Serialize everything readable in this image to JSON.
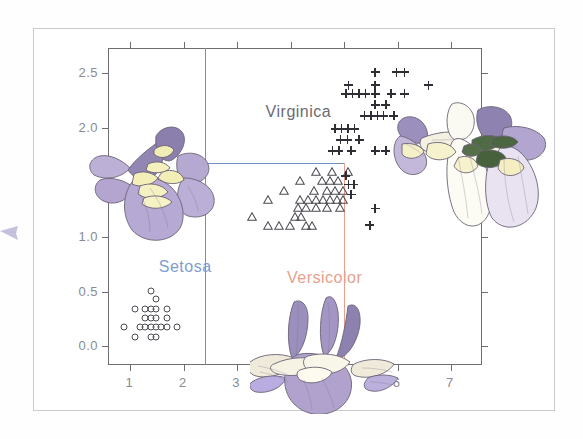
{
  "figure": {
    "arrow_icon": "right-arrow-icon",
    "frame_color": "#c9c9cf"
  },
  "chart_data": {
    "type": "scatter",
    "title": "",
    "subtitle": "",
    "xlabel": "",
    "ylabel": "",
    "xlim": [
      0.6,
      7.6
    ],
    "ylim": [
      -0.18,
      2.72
    ],
    "xticks": [
      "1",
      "2",
      "3",
      "4",
      "5",
      "6",
      "7"
    ],
    "xtick_values": [
      1,
      2,
      3,
      4,
      5,
      6,
      7
    ],
    "yticks": [
      "0.0",
      "0.5",
      "1.0",
      "1.5",
      "2.0",
      "2.5"
    ],
    "ytick_values": [
      0.0,
      0.5,
      1.0,
      1.5,
      2.0,
      2.5
    ],
    "ytick_hidden": [
      "1.5"
    ],
    "grid": false,
    "legend": "inline-annotations",
    "annotations": [
      {
        "text": "Setosa",
        "x": 1.55,
        "y": 0.8,
        "color": "#7e9ed0"
      },
      {
        "text": "Virginica",
        "x": 3.55,
        "y": 2.22,
        "color": "#6b6b72"
      },
      {
        "text": "Versicolor",
        "x": 3.95,
        "y": 0.7,
        "color": "#e8a08c"
      }
    ],
    "boundaries": [
      {
        "name": "setosa-versicolor-boundary",
        "orientation": "vertical",
        "x": 2.42,
        "y_from": -0.18,
        "y_to": 2.72,
        "color": "#6f8fc4"
      },
      {
        "name": "versicolor-virginica-top-boundary",
        "orientation": "horizontal",
        "y": 1.67,
        "x_from": 2.42,
        "x_to": 5.02,
        "color": "#6f8fc4"
      },
      {
        "name": "versicolor-right-boundary",
        "orientation": "vertical",
        "x": 5.02,
        "y_from": -0.18,
        "y_to": 1.67,
        "color": "#e8a08c"
      }
    ],
    "series": [
      {
        "name": "Setosa",
        "marker": "circle",
        "color": "#4a4a52",
        "points": [
          [
            1.4,
            0.5
          ],
          [
            1.5,
            0.42
          ],
          [
            1.1,
            0.33
          ],
          [
            1.3,
            0.33
          ],
          [
            1.4,
            0.33
          ],
          [
            1.5,
            0.33
          ],
          [
            1.7,
            0.33
          ],
          [
            1.3,
            0.25
          ],
          [
            1.4,
            0.25
          ],
          [
            1.5,
            0.25
          ],
          [
            1.7,
            0.25
          ],
          [
            0.9,
            0.17
          ],
          [
            1.2,
            0.17
          ],
          [
            1.3,
            0.17
          ],
          [
            1.4,
            0.17
          ],
          [
            1.5,
            0.17
          ],
          [
            1.6,
            0.17
          ],
          [
            1.7,
            0.17
          ],
          [
            1.9,
            0.17
          ],
          [
            1.1,
            0.08
          ],
          [
            1.4,
            0.08
          ],
          [
            1.5,
            0.08
          ]
        ]
      },
      {
        "name": "Versicolor",
        "marker": "triangle",
        "color": "#4a4a52",
        "points": [
          [
            4.5,
            1.55
          ],
          [
            4.8,
            1.55
          ],
          [
            5.1,
            1.55
          ],
          [
            4.2,
            1.47
          ],
          [
            4.6,
            1.47
          ],
          [
            4.75,
            1.47
          ],
          [
            4.9,
            1.47
          ],
          [
            3.9,
            1.38
          ],
          [
            4.45,
            1.38
          ],
          [
            4.7,
            1.38
          ],
          [
            4.85,
            1.38
          ],
          [
            5.0,
            1.38
          ],
          [
            3.6,
            1.3
          ],
          [
            4.2,
            1.3
          ],
          [
            4.35,
            1.3
          ],
          [
            4.5,
            1.3
          ],
          [
            4.62,
            1.3
          ],
          [
            4.75,
            1.3
          ],
          [
            4.88,
            1.3
          ],
          [
            5.0,
            1.3
          ],
          [
            4.15,
            1.22
          ],
          [
            4.3,
            1.22
          ],
          [
            4.5,
            1.22
          ],
          [
            4.7,
            1.22
          ],
          [
            4.95,
            1.22
          ],
          [
            3.3,
            1.14
          ],
          [
            4.1,
            1.14
          ],
          [
            4.22,
            1.14
          ],
          [
            3.6,
            1.06
          ],
          [
            3.8,
            1.06
          ],
          [
            4.0,
            1.06
          ],
          [
            4.3,
            1.06
          ],
          [
            4.42,
            1.06
          ]
        ]
      },
      {
        "name": "Virginica",
        "marker": "plus",
        "color": "#2e2e34",
        "points": [
          [
            5.6,
            2.5
          ],
          [
            6.0,
            2.5
          ],
          [
            6.15,
            2.5
          ],
          [
            5.1,
            2.38
          ],
          [
            5.6,
            2.38
          ],
          [
            6.6,
            2.38
          ],
          [
            5.05,
            2.3
          ],
          [
            5.18,
            2.3
          ],
          [
            5.3,
            2.3
          ],
          [
            5.42,
            2.3
          ],
          [
            5.6,
            2.3
          ],
          [
            5.9,
            2.3
          ],
          [
            6.15,
            2.3
          ],
          [
            5.6,
            2.2
          ],
          [
            5.8,
            2.2
          ],
          [
            5.4,
            2.1
          ],
          [
            5.52,
            2.1
          ],
          [
            5.64,
            2.1
          ],
          [
            5.76,
            2.1
          ],
          [
            5.95,
            2.1
          ],
          [
            4.85,
            1.98
          ],
          [
            4.97,
            1.98
          ],
          [
            5.09,
            1.98
          ],
          [
            5.21,
            1.98
          ],
          [
            4.95,
            1.88
          ],
          [
            5.08,
            1.88
          ],
          [
            5.3,
            1.88
          ],
          [
            4.8,
            1.78
          ],
          [
            4.92,
            1.78
          ],
          [
            5.15,
            1.78
          ],
          [
            5.6,
            1.78
          ],
          [
            5.8,
            1.78
          ],
          [
            5.05,
            1.55
          ],
          [
            5.1,
            1.47
          ],
          [
            5.2,
            1.47
          ],
          [
            5.15,
            1.38
          ],
          [
            5.6,
            1.25
          ],
          [
            5.5,
            1.1
          ]
        ]
      }
    ]
  },
  "illustrations": [
    {
      "name": "iris-setosa-illustration",
      "position": "left"
    },
    {
      "name": "iris-versicolor-illustration",
      "position": "bottom-center"
    },
    {
      "name": "iris-virginica-illustration",
      "position": "right"
    }
  ]
}
